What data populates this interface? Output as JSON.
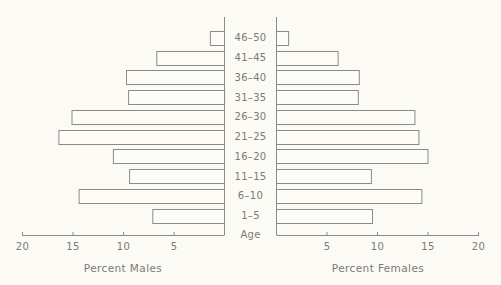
{
  "chart_data": {
    "type": "bar",
    "subtype": "population-pyramid",
    "title": "",
    "center_label": "Age",
    "categories": [
      "1-5",
      "6-10",
      "11-15",
      "16-20",
      "21-25",
      "26-30",
      "31-35",
      "36-40",
      "41-45",
      "46-50"
    ],
    "series": [
      {
        "name": "Percent Males",
        "side": "left",
        "values": [
          7.1,
          14.4,
          9.4,
          11.0,
          16.4,
          15.1,
          9.5,
          9.7,
          6.7,
          1.4
        ]
      },
      {
        "name": "Percent Females",
        "side": "right",
        "values": [
          9.5,
          14.4,
          9.4,
          15.0,
          14.1,
          13.7,
          8.1,
          8.2,
          6.1,
          1.2
        ]
      }
    ],
    "left_axis": {
      "label": "Percent Males",
      "ticks": [
        20,
        15,
        10,
        5
      ],
      "range": [
        20,
        0
      ]
    },
    "right_axis": {
      "label": "Percent Females",
      "ticks": [
        5,
        10,
        15,
        20
      ],
      "range": [
        0,
        20
      ]
    },
    "grid": false,
    "legend": "none",
    "colors": {
      "bar_fill": "#fdfcf7",
      "bar_stroke": "#8a8a8a",
      "background": "#fbfaf4",
      "text": "#7a7a7a"
    }
  }
}
